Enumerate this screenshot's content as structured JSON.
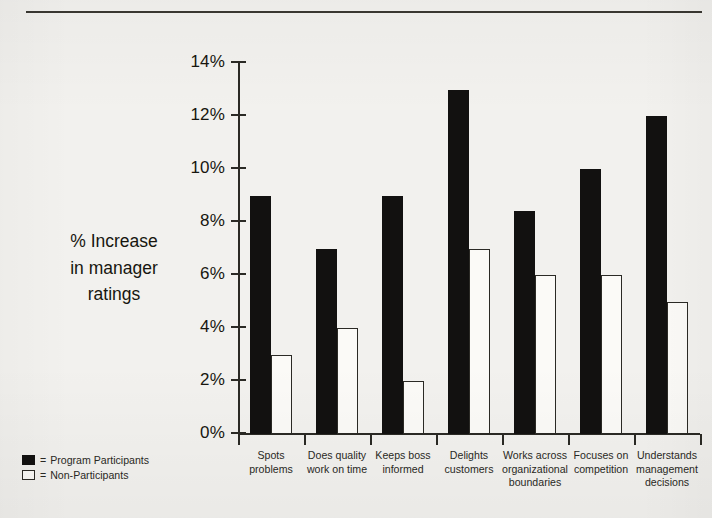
{
  "chart_data": {
    "type": "bar",
    "title": "",
    "xlabel": "",
    "ylabel": "% Increase in manager ratings",
    "ylabel_lines": [
      "% Increase",
      "in manager",
      "ratings"
    ],
    "ylim": [
      0,
      14
    ],
    "ytick_labels": [
      "0%",
      "2%",
      "4%",
      "6%",
      "8%",
      "10%",
      "12%",
      "14%"
    ],
    "ytick_values": [
      0,
      2,
      4,
      6,
      8,
      10,
      12,
      14
    ],
    "grid": false,
    "legend_position": "bottom-left",
    "categories": [
      "Spots problems",
      "Does quality work on time",
      "Keeps boss informed",
      "Delights customers",
      "Works across organizational boundaries",
      "Focuses on competition",
      "Understands management decisions"
    ],
    "category_lines": [
      [
        "Spots",
        "problems"
      ],
      [
        "Does quality",
        "work on time"
      ],
      [
        "Keeps boss",
        "informed"
      ],
      [
        "Delights",
        "customers"
      ],
      [
        "Works across",
        "organizational",
        "boundaries"
      ],
      [
        "Focuses on",
        "competition"
      ],
      [
        "Understands",
        "management",
        "decisions"
      ]
    ],
    "series": [
      {
        "name": "Program Participants",
        "color": "#121110",
        "values": [
          9,
          7,
          9,
          13,
          8.4,
          10,
          12
        ]
      },
      {
        "name": "Non-Participants",
        "color": "#ffffff",
        "values": [
          3,
          4,
          2,
          7,
          6,
          6,
          5
        ]
      }
    ]
  },
  "legend": {
    "separator": "=",
    "entries": [
      {
        "swatch": "filled-square",
        "label": "Program Participants"
      },
      {
        "swatch": "hollow-square",
        "label": "Non-Participants"
      }
    ]
  },
  "colors": {
    "background": "#f2f1ee",
    "ink": "#17160f",
    "axis": "#2b2a25",
    "bar_dark": "#121110",
    "bar_light": "#fbfaf7"
  }
}
